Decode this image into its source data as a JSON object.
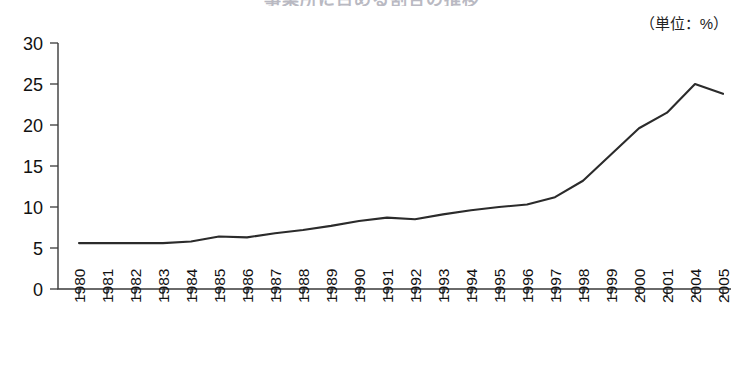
{
  "title_cropped": "事業所に占める割合の推移",
  "unit_label": "（単位：%）",
  "axis": {
    "y_ticks": [
      "0",
      "5",
      "10",
      "15",
      "20",
      "25",
      "30"
    ],
    "x_ticks": [
      "1980",
      "1981",
      "1982",
      "1983",
      "1984",
      "1985",
      "1986",
      "1987",
      "1988",
      "1989",
      "1990",
      "1991",
      "1992",
      "1993",
      "1994",
      "1995",
      "1996",
      "1997",
      "1998",
      "1999",
      "2000",
      "2001",
      "2004",
      "2005"
    ]
  },
  "colors": {
    "line": "#2b2b2b",
    "axis": "#3a3a3a",
    "text": "#111111",
    "background": "#ffffff"
  },
  "chart_data": {
    "type": "line",
    "title": "",
    "xlabel": "",
    "ylabel": "",
    "unit": "%",
    "grid": false,
    "legend": "none",
    "ylim": [
      0,
      30
    ],
    "ytick_step": 5,
    "categories": [
      "1980",
      "1981",
      "1982",
      "1983",
      "1984",
      "1985",
      "1986",
      "1987",
      "1988",
      "1989",
      "1990",
      "1991",
      "1992",
      "1993",
      "1994",
      "1995",
      "1996",
      "1997",
      "1998",
      "1999",
      "2000",
      "2001",
      "2004",
      "2005"
    ],
    "series": [
      {
        "name": "割合",
        "values": [
          5.6,
          5.6,
          5.6,
          5.6,
          5.8,
          6.4,
          6.3,
          6.8,
          7.2,
          7.7,
          8.3,
          8.7,
          8.5,
          9.1,
          9.6,
          10.0,
          10.3,
          11.2,
          13.2,
          16.4,
          19.6,
          21.5,
          25.0,
          23.8
        ]
      }
    ],
    "note_missing_years": [
      "2002",
      "2003"
    ]
  }
}
